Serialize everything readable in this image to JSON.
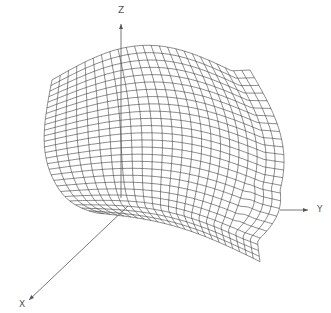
{
  "figure": {
    "type": "3d-wireframe-surface",
    "background": "#ffffff",
    "line_color": "#3a3a3a",
    "axis_color": "#555555"
  },
  "axes": {
    "z": {
      "label": "Z",
      "from": [
        121,
        198
      ],
      "to": [
        121,
        24
      ],
      "label_pos": [
        118,
        6
      ]
    },
    "y": {
      "label": "Y",
      "from": [
        280,
        210
      ],
      "to": [
        308,
        210
      ],
      "label_pos": [
        317,
        205
      ]
    },
    "x": {
      "label": "X",
      "from": [
        128,
        206
      ],
      "to": [
        29,
        300
      ],
      "label_pos": [
        19,
        300
      ]
    }
  },
  "surface": {
    "rows": 26,
    "cols": 24,
    "description": "Wireframe mesh surface bulging toward the viewer, with a raised plateau at the top and a flattened skirt near the X/Y base plane"
  }
}
